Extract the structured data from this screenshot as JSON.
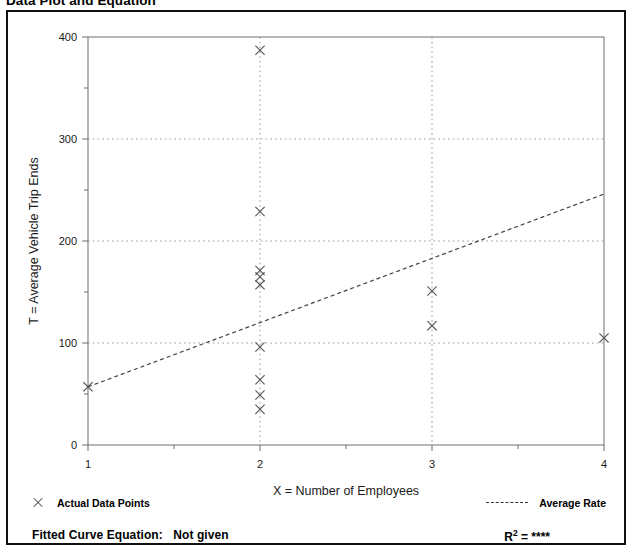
{
  "page_title": "Data Plot and Equation",
  "legend": {
    "data_points_label": "Actual Data Points",
    "data_points_marker": "x-marker-icon",
    "average_rate_label": "Average Rate",
    "average_rate_marker": "dashed-line-icon"
  },
  "footer": {
    "equation_label": "Fitted Curve Equation:",
    "equation_value": "Not given",
    "r_symbol": "R",
    "r_exponent": "2",
    "r_equals": "=",
    "r_value": "****"
  },
  "chart_data": {
    "type": "scatter",
    "title": "Data Plot and Equation",
    "xlabel": "X = Number of Employees",
    "ylabel": "T = Average Vehicle Trip Ends",
    "xlim": [
      1,
      4
    ],
    "ylim": [
      0,
      400
    ],
    "xticks": [
      1,
      2,
      3,
      4
    ],
    "xtick_labels": [
      "1",
      "2",
      "3",
      "4"
    ],
    "x_minor_ticks": [
      1.5,
      2.5,
      3.5
    ],
    "yticks": [
      0,
      100,
      200,
      300,
      400
    ],
    "ytick_labels": [
      "0",
      "100",
      "200",
      "300",
      "400"
    ],
    "y_minor_ticks": [
      50,
      150,
      250,
      350
    ],
    "grid": "dotted-at-major-ticks",
    "legend_position": "below-axes",
    "series": [
      {
        "name": "Actual Data Points",
        "type": "scatter",
        "marker": "x",
        "color": "#555555",
        "points": [
          {
            "x": 1,
            "y": 57
          },
          {
            "x": 2,
            "y": 387
          },
          {
            "x": 2,
            "y": 229
          },
          {
            "x": 2,
            "y": 171
          },
          {
            "x": 2,
            "y": 165
          },
          {
            "x": 2,
            "y": 157
          },
          {
            "x": 2,
            "y": 96
          },
          {
            "x": 2,
            "y": 64
          },
          {
            "x": 2,
            "y": 49
          },
          {
            "x": 2,
            "y": 35
          },
          {
            "x": 3,
            "y": 151
          },
          {
            "x": 3,
            "y": 117
          },
          {
            "x": 4,
            "y": 105
          }
        ]
      },
      {
        "name": "Average Rate",
        "type": "line",
        "style": "dashed",
        "color": "#444444",
        "endpoints": [
          {
            "x": 1,
            "y": 57
          },
          {
            "x": 4,
            "y": 246
          }
        ]
      }
    ]
  }
}
